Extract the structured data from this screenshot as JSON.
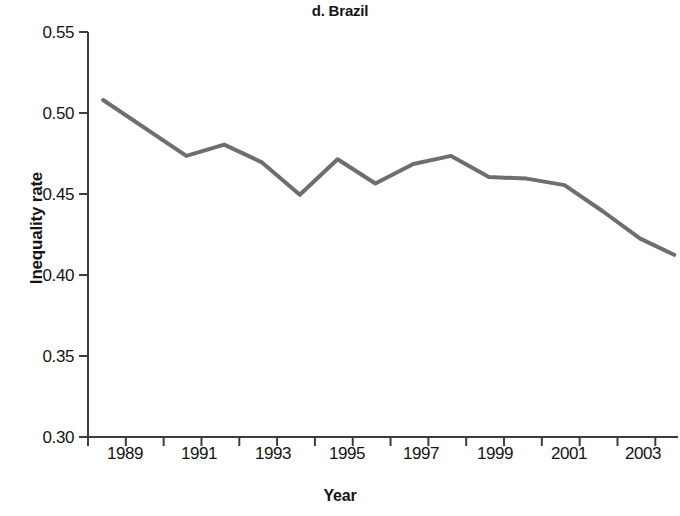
{
  "chart_data": {
    "type": "line",
    "title": "d. Brazil",
    "xlabel": "Year",
    "ylabel": "Inequality rate",
    "xlim": [
      1988,
      2003.6
    ],
    "ylim": [
      0.3,
      0.55
    ],
    "grid": false,
    "legend": null,
    "line_color": "#6e6e6e",
    "line_width": 4,
    "yticks": [
      "0.55",
      "0.50",
      "0.45",
      "0.40",
      "0.35",
      "0.30"
    ],
    "ytick_values": [
      0.55,
      0.5,
      0.45,
      0.4,
      0.35,
      0.3
    ],
    "xticks": [
      "1989",
      "1991",
      "1993",
      "1995",
      "1997",
      "1999",
      "2001",
      "2003"
    ],
    "xtick_values": [
      1989,
      1991,
      1993,
      1995,
      1997,
      1999,
      2001,
      2003
    ],
    "xminor_step": 1,
    "series": [
      {
        "name": "Inequality rate",
        "x": [
          1988.4,
          1990.6,
          1991.6,
          1992.6,
          1993.6,
          1994.6,
          1995.6,
          1996.6,
          1997.6,
          1998.6,
          1999.6,
          2000.6,
          2001.6,
          2002.6,
          2003.5
        ],
        "values": [
          0.508,
          0.4735,
          0.4805,
          0.4695,
          0.4495,
          0.4715,
          0.4565,
          0.4685,
          0.4735,
          0.4605,
          0.4595,
          0.4555,
          0.4395,
          0.4225,
          0.4125
        ]
      }
    ]
  }
}
